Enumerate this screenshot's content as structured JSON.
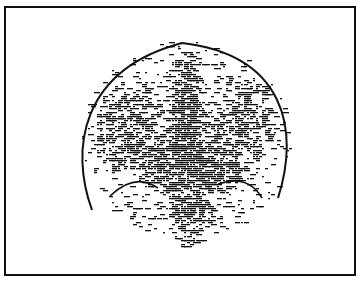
{
  "figure": {
    "type": "scintigraphy-scan",
    "view": "frontal-brain",
    "render_style": "dash-stipple",
    "colors": {
      "background": "#ffffff",
      "ink": "#111111",
      "frame": "#111111"
    },
    "frame": {
      "x": 4,
      "y": 6,
      "width": 350,
      "height": 268
    },
    "head_outline": {
      "left_end": [
        92,
        210
      ],
      "top_left": [
        110,
        62
      ],
      "apex": [
        182,
        42
      ],
      "top_right": [
        262,
        58
      ],
      "right_end": [
        278,
        198
      ]
    },
    "inner_curves": [
      {
        "name": "left-basal-curve",
        "from": [
          110,
          196
        ],
        "via": [
          135,
          175
        ],
        "to": [
          158,
          188
        ]
      },
      {
        "name": "right-basal-curve",
        "from": [
          218,
          185
        ],
        "via": [
          245,
          175
        ],
        "to": [
          262,
          198
        ]
      }
    ],
    "density_regions": [
      {
        "name": "midline-column",
        "cx": 185,
        "cy": 150,
        "rx": 22,
        "ry": 100,
        "density": 0.9
      },
      {
        "name": "left-hemisphere",
        "cx": 130,
        "cy": 130,
        "rx": 38,
        "ry": 48,
        "density": 0.55
      },
      {
        "name": "right-hemisphere",
        "cx": 240,
        "cy": 120,
        "rx": 35,
        "ry": 45,
        "density": 0.55
      },
      {
        "name": "central-mass",
        "cx": 190,
        "cy": 160,
        "rx": 60,
        "ry": 38,
        "density": 0.8
      },
      {
        "name": "brainstem-lower",
        "cx": 190,
        "cy": 215,
        "rx": 22,
        "ry": 30,
        "density": 0.65
      },
      {
        "name": "outer-halo",
        "cx": 185,
        "cy": 140,
        "rx": 105,
        "ry": 100,
        "density": 0.16
      }
    ]
  }
}
